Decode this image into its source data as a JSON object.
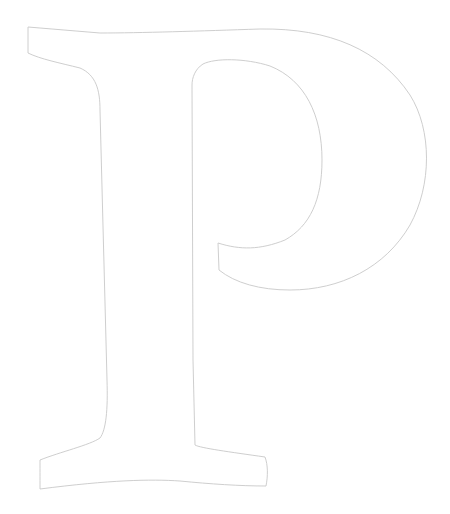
{
  "figure": {
    "glyph": "P",
    "style": "outline",
    "stroke_color": "#c8c8c8",
    "background_color": "#ffffff"
  }
}
